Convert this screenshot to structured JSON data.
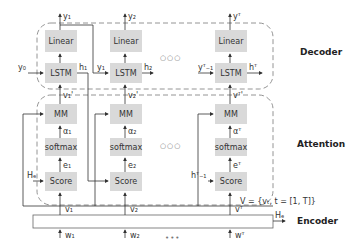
{
  "sections": {
    "decoder": "Decoder",
    "attention": "Attention",
    "encoder": "Encoder"
  },
  "blocks": {
    "linear": "Linear",
    "lstm": "LSTM",
    "mm": "MM",
    "softmax": "softmax",
    "score": "Score"
  },
  "columns": [
    {
      "y": "y₁",
      "y_in": "y₀",
      "h": "h₁",
      "v_prime": "v₁'",
      "alpha": "α₁",
      "e": "e₁",
      "score_in": "Hₑ",
      "v": "v₁",
      "w": "w₁"
    },
    {
      "y": "y₂",
      "y_in": "y₁",
      "h": "h₂",
      "v_prime": "v₂'",
      "alpha": "α₂",
      "e": "e₂",
      "score_in": "",
      "v": "v₂",
      "w": "w₂"
    },
    {
      "y": "yᵀ",
      "y_in": "yᵀ₋₁",
      "h": "hᵀ",
      "v_prime": "vᵀ'",
      "alpha": "αᵀ",
      "e": "eᵀ",
      "score_in": "hᵀ₋₁",
      "v": "vᵀ",
      "w": "wᵀ"
    }
  ],
  "ellipsis_open": "○○○",
  "ellipsis_dots": "•••",
  "set_definition": "V = {vₜ, t = [1, T]}",
  "encoder_output": "Hₑ"
}
